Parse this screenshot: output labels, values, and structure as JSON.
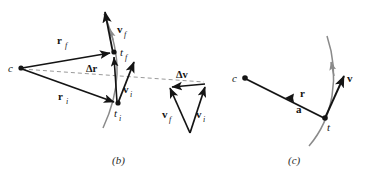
{
  "figure": {
    "colors": {
      "ink": "#141414",
      "trajectory_gray": "#8a8a8a",
      "dashed_gray": "#9a9a9a",
      "background": "#ffffff"
    },
    "panels": [
      {
        "id": "panel-b",
        "caption": "(b)",
        "points": [
          {
            "name": "c",
            "label": "c",
            "style": "italic",
            "x": 20,
            "y": 68
          },
          {
            "name": "t_f",
            "label": "t",
            "sub": "f",
            "style": "italic",
            "x": 114,
            "y": 52
          },
          {
            "name": "t_i",
            "label": "t",
            "sub": "i",
            "style": "italic",
            "x": 118,
            "y": 103
          }
        ],
        "vectors": [
          {
            "name": "r_f",
            "label": "r",
            "sub": "f",
            "bold": true
          },
          {
            "name": "r_i",
            "label": "r",
            "sub": "i",
            "bold": true
          },
          {
            "name": "delta_r",
            "label": "Δr",
            "bold": true
          },
          {
            "name": "v_f",
            "label": "v",
            "sub": "f",
            "bold": true
          },
          {
            "name": "v_i",
            "label": "v",
            "sub": "i",
            "bold": true
          }
        ],
        "velocity_triangle": {
          "name": "velocity-difference-triangle",
          "vectors": [
            {
              "name": "delta_v",
              "label": "Δv",
              "bold": true
            },
            {
              "name": "v_f_tri",
              "label": "v",
              "sub": "f",
              "bold": true
            },
            {
              "name": "v_i_tri",
              "label": "v",
              "sub": "i",
              "bold": true
            }
          ]
        }
      },
      {
        "id": "panel-c",
        "caption": "(c)",
        "points": [
          {
            "name": "c",
            "label": "c",
            "style": "italic",
            "x": 245,
            "y": 78
          },
          {
            "name": "t",
            "label": "t",
            "style": "italic",
            "x": 325,
            "y": 118
          }
        ],
        "vectors": [
          {
            "name": "r",
            "label": "r",
            "bold": true
          },
          {
            "name": "a",
            "label": "a",
            "bold": true
          },
          {
            "name": "v",
            "label": "v",
            "bold": true
          }
        ]
      }
    ]
  }
}
